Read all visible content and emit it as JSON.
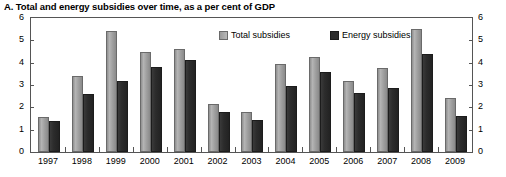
{
  "chart_data": {
    "type": "bar",
    "title": "A. Total and energy subsidies over time, as a per cent of GDP",
    "xlabel": "",
    "ylabel": "",
    "ylim": [
      0,
      6
    ],
    "yticks": [
      0,
      1,
      2,
      3,
      4,
      5,
      6
    ],
    "grid": false,
    "legend_position": "top-center",
    "dual_axis": true,
    "categories": [
      "1997",
      "1998",
      "1999",
      "2000",
      "2001",
      "2002",
      "2003",
      "2004",
      "2005",
      "2006",
      "2007",
      "2008",
      "2009"
    ],
    "series": [
      {
        "name": "Total subsidies",
        "color": "#a0a0a0",
        "values": [
          1.55,
          3.4,
          5.4,
          4.5,
          4.6,
          2.15,
          1.8,
          3.95,
          4.25,
          3.2,
          3.75,
          5.5,
          2.4
        ]
      },
      {
        "name": "Energy subsidies",
        "color": "#2c2c2c",
        "values": [
          1.4,
          2.6,
          3.2,
          3.8,
          4.1,
          1.8,
          1.45,
          2.95,
          3.6,
          2.65,
          2.85,
          4.4,
          1.6
        ]
      }
    ]
  }
}
